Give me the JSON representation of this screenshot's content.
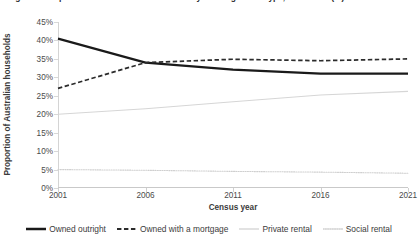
{
  "chart": {
    "title": "Figure 1: Proportion of Australian households by housing tenure type, 2001–2021 (%)",
    "xlabel": "Census year",
    "ylabel": "Proportion of Australian households"
  },
  "chart_data": {
    "type": "line",
    "title": "Figure 1: Proportion of Australian households by housing tenure type, 2001–2021 (%)",
    "xlabel": "Census year",
    "ylabel": "Proportion of Australian households",
    "categories": [
      "2001",
      "2006",
      "2011",
      "2016",
      "2021"
    ],
    "x": [
      2001,
      2006,
      2011,
      2016,
      2021
    ],
    "xlim": [
      2001,
      2021
    ],
    "ylim": [
      0,
      45
    ],
    "ytick_labels": [
      "0%",
      "5%",
      "10%",
      "15%",
      "20%",
      "25%",
      "30%",
      "35%",
      "40%",
      "45%"
    ],
    "ytick_values": [
      0,
      5,
      10,
      15,
      20,
      25,
      30,
      35,
      40,
      45
    ],
    "grid": false,
    "legend_position": "bottom",
    "series": [
      {
        "name": "Owned outright",
        "style": "solid",
        "width": 2.2,
        "color": "#1a1a1a",
        "values": [
          40.5,
          34.0,
          32.1,
          31.0,
          31.0
        ]
      },
      {
        "name": "Owned with a mortgage",
        "style": "dashed",
        "width": 1.7,
        "color": "#2b2b2b",
        "values": [
          27.0,
          34.0,
          34.9,
          34.5,
          35.0
        ]
      },
      {
        "name": "Private rental",
        "style": "solid",
        "width": 1.1,
        "color": "#d6d6d6",
        "values": [
          20.0,
          21.5,
          23.4,
          25.2,
          26.2
        ]
      },
      {
        "name": "Social rental",
        "style": "dotted",
        "width": 1.1,
        "color": "#cfcfcf",
        "values": [
          5.0,
          4.8,
          4.5,
          4.3,
          4.0
        ]
      }
    ]
  }
}
